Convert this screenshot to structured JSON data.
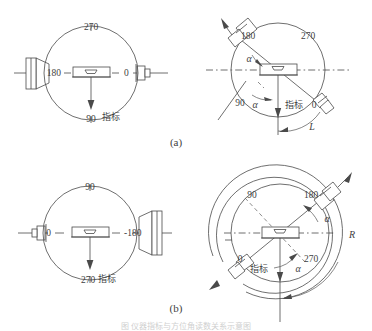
{
  "figure": {
    "caption_a": "(a)",
    "caption_b": "(b)",
    "bottom_caption": "图 仪器指标与方位角读数关系示意图"
  },
  "panels": {
    "a_left": {
      "name": "top-left-dial",
      "marks": {
        "top": "270",
        "left": "180",
        "right": "0",
        "bottom": "90"
      },
      "pointer_label": "指标"
    },
    "a_right": {
      "name": "top-right-dial",
      "marks": {
        "upper_left": "180",
        "upper_right": "270",
        "lower_left": "90",
        "lower_right": "0"
      },
      "pointer_label": "指标",
      "angle_label_upper": "α",
      "angle_label_lower": "α",
      "arc_label": "L"
    },
    "b_left": {
      "name": "bottom-left-dial",
      "marks": {
        "top": "90",
        "left": "0",
        "right": "-180",
        "bottom": "270"
      },
      "pointer_label": "指标"
    },
    "b_right": {
      "name": "bottom-right-dial",
      "marks": {
        "upper_left": "90",
        "upper_right": "180",
        "lower_left": "0",
        "lower_right": "270"
      },
      "pointer_label": "指标",
      "angle_label_upper": "α",
      "angle_label_lower": "α",
      "arc_label": "R"
    }
  },
  "colors": {
    "stroke": "#4a4a4a",
    "text": "#3f3f3f",
    "background": "#ffffff"
  }
}
